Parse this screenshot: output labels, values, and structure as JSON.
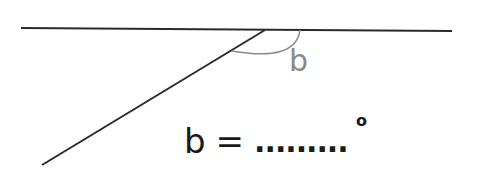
{
  "diagram": {
    "colors": {
      "line": "#2a2a2a",
      "arc": "#8a8a8a",
      "label": "#8a8a8a",
      "text": "#1a1a1a"
    },
    "horizontal_line": {
      "x1": 21,
      "y1": 28,
      "x2": 452,
      "y2": 31
    },
    "diagonal_line": {
      "x1": 265,
      "y1": 30,
      "x2": 42,
      "y2": 165
    },
    "angle_arc": {
      "from": [
        300,
        30
      ],
      "to": [
        232,
        51
      ]
    },
    "angle_label": "b"
  },
  "question": {
    "variable": "b",
    "equals": "=",
    "blank": ".........",
    "unit": "o"
  }
}
